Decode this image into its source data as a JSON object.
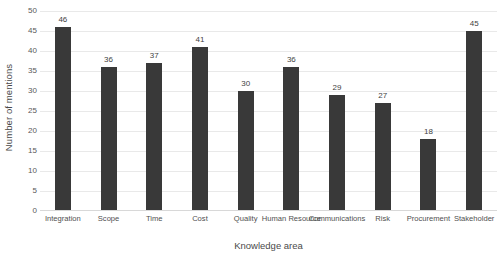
{
  "chart_data": {
    "type": "bar",
    "title": "",
    "xlabel": "Knowledge area",
    "ylabel": "Number of mentions",
    "categories": [
      "Integration",
      "Scope",
      "Time",
      "Cost",
      "Quality",
      "Human Resource",
      "Communications",
      "Risk",
      "Procurement",
      "Stakeholder"
    ],
    "values": [
      46,
      36,
      37,
      41,
      30,
      36,
      29,
      27,
      18,
      45
    ],
    "ylim": [
      0,
      50
    ],
    "ytick_step": 5,
    "yticks": [
      0,
      5,
      10,
      15,
      20,
      25,
      30,
      35,
      40,
      45,
      50
    ],
    "ytick_labels": [
      "0",
      "5",
      "10",
      "15",
      "20",
      "25",
      "30",
      "35",
      "40",
      "45",
      "50"
    ],
    "data_labels": [
      "46",
      "36",
      "37",
      "41",
      "30",
      "36",
      "29",
      "27",
      "18",
      "45"
    ],
    "grid": true,
    "grid_axis": "y",
    "legend": false,
    "bar_color": "#393939",
    "grid_color": "#e9e9e9",
    "text_color": "#4a4a4a"
  }
}
